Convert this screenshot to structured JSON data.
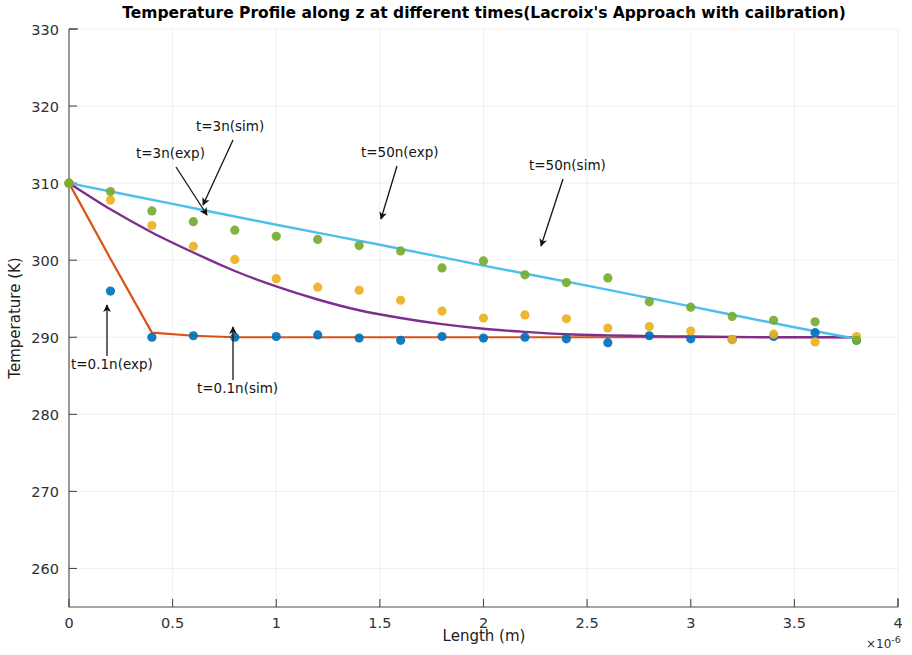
{
  "chart_data": {
    "type": "scatter",
    "title": "Temperature Profile along z at different times(Lacroix's Approach with cailbration)",
    "xlabel": "Length (m)",
    "ylabel": "Temperature (K)",
    "x_multiplier": "×10",
    "x_multiplier_exponent": "-6",
    "xlim": [
      0,
      4
    ],
    "ylim": [
      255,
      330
    ],
    "xticks": [
      0,
      0.5,
      1,
      1.5,
      2,
      2.5,
      3,
      3.5,
      4
    ],
    "xticklabels": [
      "0",
      "0.5",
      "1",
      "1.5",
      "2",
      "2.5",
      "3",
      "3.5",
      "4"
    ],
    "yticks": [
      260,
      270,
      280,
      290,
      300,
      310,
      320,
      330
    ],
    "yticklabels": [
      "260",
      "270",
      "280",
      "290",
      "300",
      "310",
      "320",
      "330"
    ],
    "grid": true,
    "legend_position": "none",
    "series": [
      {
        "name": "t=0.1n(sim)",
        "label": "t=0.1n(sim)",
        "kind": "line",
        "color": "#D95319",
        "linewidth": 2.2,
        "x": [
          0,
          0.2,
          0.4,
          0.6,
          0.8,
          1.0,
          1.2,
          1.4,
          1.6,
          1.8,
          2.0,
          2.2,
          2.4,
          2.6,
          2.8,
          3.0,
          3.2,
          3.4,
          3.6,
          3.8
        ],
        "y": [
          310.0,
          300.2,
          290.6,
          290.2,
          290.0,
          290.0,
          290.0,
          290.0,
          290.0,
          290.0,
          290.0,
          290.0,
          290.0,
          290.0,
          290.0,
          290.0,
          290.0,
          290.0,
          290.0,
          290.0
        ]
      },
      {
        "name": "t=3n(sim)",
        "label": "t=3n(sim)",
        "kind": "line",
        "color": "#7E2F8E",
        "linewidth": 2.4,
        "x": [
          0,
          0.2,
          0.4,
          0.6,
          0.8,
          1.0,
          1.2,
          1.4,
          1.6,
          1.8,
          2.0,
          2.2,
          2.4,
          2.6,
          2.8,
          3.0,
          3.2,
          3.4,
          3.6,
          3.8
        ],
        "y": [
          310.0,
          306.6,
          303.6,
          301.0,
          298.6,
          296.6,
          294.9,
          293.5,
          292.5,
          291.7,
          291.1,
          290.7,
          290.4,
          290.25,
          290.15,
          290.1,
          290.05,
          290.0,
          290.0,
          290.0
        ]
      },
      {
        "name": "t=50n(sim)",
        "label": "t=50n(sim)",
        "kind": "line",
        "color": "#4DBEEE",
        "linewidth": 2.4,
        "x": [
          0,
          0.5,
          1.0,
          1.5,
          2.0,
          2.5,
          3.0,
          3.5,
          3.8
        ],
        "y": [
          310.0,
          307.3,
          304.6,
          302.0,
          299.3,
          296.7,
          294.0,
          291.3,
          289.8
        ]
      },
      {
        "name": "t=0.1n(exp)",
        "label": "t=0.1n(exp)",
        "kind": "scatter",
        "color": "#0072BD",
        "x": [
          0,
          0.2,
          0.4,
          0.6,
          0.8,
          1.0,
          1.2,
          1.4,
          1.6,
          1.8,
          2.0,
          2.2,
          2.4,
          2.6,
          2.8,
          3.0,
          3.2,
          3.4,
          3.6,
          3.8
        ],
        "y": [
          310.0,
          296.0,
          290.0,
          290.2,
          290.0,
          290.1,
          290.3,
          289.9,
          289.6,
          290.1,
          289.9,
          290.0,
          289.8,
          289.3,
          290.2,
          289.8,
          289.7,
          290.1,
          290.6,
          289.6
        ]
      },
      {
        "name": "t=3n(exp)",
        "label": "t=3n(exp)",
        "kind": "scatter",
        "color": "#EDB120",
        "x": [
          0,
          0.2,
          0.4,
          0.6,
          0.8,
          1.0,
          1.2,
          1.4,
          1.6,
          1.8,
          2.0,
          2.2,
          2.4,
          2.6,
          2.8,
          3.0,
          3.2,
          3.4,
          3.6,
          3.8
        ],
        "y": [
          310.0,
          307.8,
          304.5,
          301.8,
          300.1,
          297.6,
          296.5,
          296.1,
          294.8,
          293.4,
          292.5,
          292.9,
          292.4,
          291.2,
          291.4,
          290.8,
          289.7,
          290.4,
          289.4,
          290.1
        ]
      },
      {
        "name": "t=50n(exp)",
        "label": "t=50n(exp)",
        "kind": "scatter",
        "color": "#77AC30",
        "x": [
          0,
          0.2,
          0.4,
          0.6,
          0.8,
          1.0,
          1.2,
          1.4,
          1.6,
          1.8,
          2.0,
          2.2,
          2.4,
          2.6,
          2.8,
          3.0,
          3.2,
          3.4,
          3.6,
          3.8
        ],
        "y": [
          310.0,
          308.9,
          306.4,
          305.0,
          303.9,
          303.1,
          302.7,
          301.9,
          301.2,
          299.0,
          299.9,
          298.1,
          297.1,
          297.7,
          294.6,
          293.9,
          292.7,
          292.2,
          292.0,
          289.6
        ]
      }
    ],
    "annotations": [
      {
        "text": "t=3n(exp)",
        "text_x": 136,
        "text_y": 158,
        "arrow_from_x": 176,
        "arrow_from_y": 167,
        "arrow_to_x": 207,
        "arrow_to_y": 215
      },
      {
        "text": "t=3n(sim)",
        "text_x": 196,
        "text_y": 131,
        "arrow_from_x": 233,
        "arrow_from_y": 140,
        "arrow_to_x": 203,
        "arrow_to_y": 205
      },
      {
        "text": "t=50n(exp)",
        "text_x": 361,
        "text_y": 157,
        "arrow_from_x": 397,
        "arrow_from_y": 166,
        "arrow_to_x": 381,
        "arrow_to_y": 219
      },
      {
        "text": "t=50n(sim)",
        "text_x": 529,
        "text_y": 170,
        "arrow_from_x": 563,
        "arrow_from_y": 179,
        "arrow_to_x": 541,
        "arrow_to_y": 246
      },
      {
        "text": "t=0.1n(exp)",
        "text_x": 71,
        "text_y": 369,
        "arrow_from_x": 107,
        "arrow_from_y": 356,
        "arrow_to_x": 107,
        "arrow_to_y": 305
      },
      {
        "text": "t=0.1n(sim)",
        "text_x": 197,
        "text_y": 393,
        "arrow_from_x": 233,
        "arrow_from_y": 380,
        "arrow_to_x": 233,
        "arrow_to_y": 327
      }
    ]
  }
}
